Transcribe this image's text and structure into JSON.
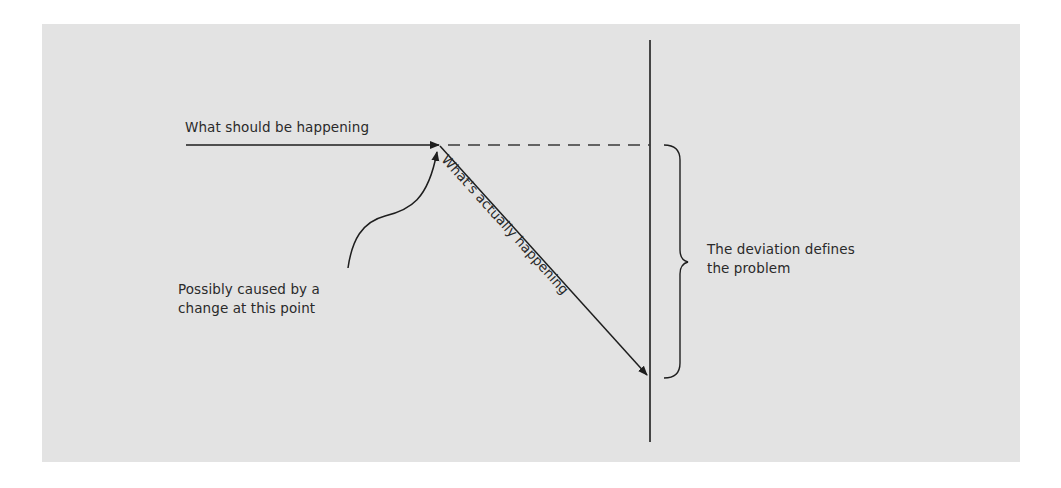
{
  "diagram": {
    "background_color": "#e3e3e3",
    "line_color": "#1e1e1e",
    "labels": {
      "expected": "What should be happening",
      "actual": "What's actually happening",
      "cause_line1": "Possibly caused by a",
      "cause_line2": "change at this point",
      "deviation_line1": "The deviation defines",
      "deviation_line2": "the problem"
    },
    "elements": [
      {
        "id": "expected-arrow",
        "type": "horizontal-arrow",
        "from": [
          186,
          145
        ],
        "to": [
          440,
          145
        ]
      },
      {
        "id": "expected-continuation",
        "type": "dashed-line",
        "from": [
          440,
          145
        ],
        "to": [
          650,
          145
        ]
      },
      {
        "id": "actual-arrow",
        "type": "diagonal-arrow",
        "from": [
          440,
          145
        ],
        "to": [
          648,
          376
        ]
      },
      {
        "id": "time-axis",
        "type": "vertical-line",
        "from": [
          650,
          40
        ],
        "to": [
          650,
          442
        ]
      },
      {
        "id": "cause-arrow",
        "type": "curved-arrow",
        "from": [
          348,
          268
        ],
        "to": [
          437,
          150
        ]
      },
      {
        "id": "deviation-brace",
        "type": "right-brace",
        "from": [
          665,
          145
        ],
        "to": [
          665,
          378
        ]
      }
    ]
  }
}
